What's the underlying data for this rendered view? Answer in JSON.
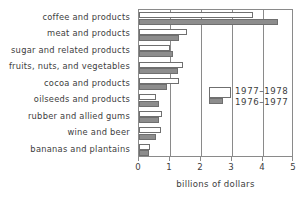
{
  "chart_data": {
    "type": "bar",
    "orientation": "horizontal",
    "title": "",
    "xlabel": "billions of dollars",
    "ylabel": "",
    "xlim": [
      0,
      5
    ],
    "xticks": [
      0,
      1,
      2,
      3,
      4,
      5
    ],
    "xtick_labels": [
      "0",
      "1",
      "2",
      "3",
      "4",
      "5"
    ],
    "grid": true,
    "grid_axis": "x",
    "legend_position": "inside-right-middle",
    "categories": [
      "coffee and products",
      "meat and products",
      "sugar and related products",
      "fruits, nuts, and vegetables",
      "cocoa and products",
      "oilseeds and products",
      "rubber and allied gums",
      "wine and beer",
      "bananas and plantains"
    ],
    "series": [
      {
        "name": "1977-1978",
        "color": "#ffffff",
        "values": [
          3.68,
          1.55,
          1.0,
          1.42,
          1.3,
          0.55,
          0.75,
          0.7,
          0.35
        ]
      },
      {
        "name": "1976-1977",
        "color": "#8d8d8d",
        "values": [
          4.48,
          1.28,
          1.1,
          1.25,
          0.9,
          0.65,
          0.65,
          0.55,
          0.32
        ]
      }
    ]
  },
  "legend": {
    "entries": [
      {
        "label": "1977–1978",
        "swatch": "white-bar-swatch"
      },
      {
        "label": "1976–1977",
        "swatch": "gray-bar-swatch"
      }
    ]
  },
  "axis": {
    "x_title": "billions of dollars"
  }
}
